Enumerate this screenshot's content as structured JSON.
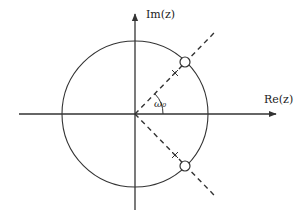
{
  "figure": {
    "colors": {
      "stroke": "#333333",
      "background": "#ffffff"
    }
  },
  "axes": {
    "x_label": "Re(z)",
    "y_label": "Im(z)"
  },
  "unit_circle": {
    "center": [
      135,
      114
    ],
    "radius": 73
  },
  "angle_label": "ω₀",
  "zeros": [
    {
      "name": "zero-upper",
      "x": 185,
      "y": 62
    },
    {
      "name": "zero-lower",
      "x": 185,
      "y": 166
    }
  ],
  "poles": [
    {
      "name": "pole-upper",
      "x": 175,
      "y": 73
    },
    {
      "name": "pole-lower",
      "x": 175,
      "y": 155
    }
  ]
}
